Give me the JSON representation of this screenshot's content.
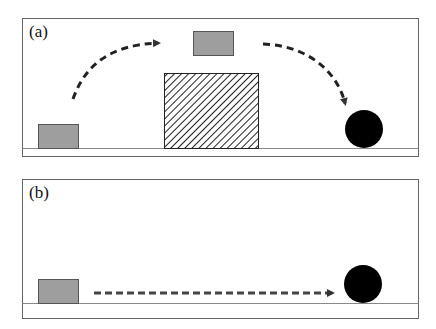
{
  "figure": {
    "panels": [
      {
        "label": "(a)",
        "description": "Block jumps over hatched obstacle, trajectory curves down toward black ball",
        "elements": [
          "start-block",
          "airborne-block",
          "hatched-obstacle",
          "ball",
          "jump-arc-arrow",
          "fall-arc-arrow"
        ]
      },
      {
        "label": "(b)",
        "description": "Block moves horizontally along ground toward black ball",
        "elements": [
          "start-block",
          "ball",
          "horizontal-arrow"
        ]
      }
    ],
    "colors": {
      "block_fill": "#9e9e9e",
      "block_stroke": "#555555",
      "ball": "#000000",
      "arrow": "#333333",
      "frame": "#666666",
      "ground": "#888888",
      "hatch": "#222222"
    }
  }
}
